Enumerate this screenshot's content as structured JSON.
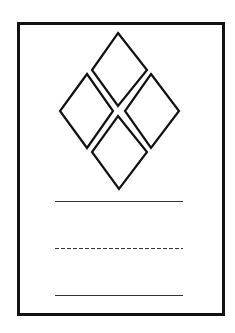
{
  "card": {
    "frame": {
      "x": 17,
      "y": 22,
      "width": 205,
      "height": 291,
      "border_width": 3,
      "border_color": "#111111",
      "fill": "#ffffff"
    },
    "emblem": {
      "stroke_color": "#111111",
      "stroke_width": 2.2,
      "diamonds": [
        {
          "name": "top",
          "points": "118,33 147,70 118,106 92,70"
        },
        {
          "name": "left",
          "points": "87,74 113,111 87,148 60,111"
        },
        {
          "name": "right",
          "points": "151,74 179,111 151,148 125,111"
        },
        {
          "name": "bottom",
          "points": "118,116 147,152 119,189 92,152"
        }
      ]
    },
    "lines": [
      {
        "name": "solid-line-1",
        "x1": 55,
        "x2": 183,
        "y": 201,
        "style": "solid",
        "color": "#333333"
      },
      {
        "name": "dashed-line",
        "x1": 55,
        "x2": 183,
        "y": 248,
        "style": "dashed",
        "dash": "4,2",
        "color": "#333333"
      },
      {
        "name": "solid-line-2",
        "x1": 55,
        "x2": 183,
        "y": 295,
        "style": "solid",
        "color": "#333333"
      }
    ]
  }
}
